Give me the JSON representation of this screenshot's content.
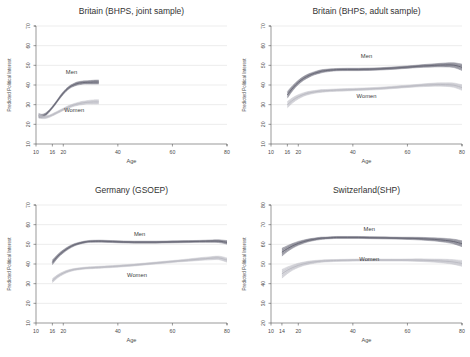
{
  "figure": {
    "title": "",
    "panel_count": 4
  },
  "chart_data": [
    {
      "type": "line",
      "title": "Britain (BHPS, joint sample)",
      "xlabel": "Age",
      "ylabel": "Predicted Political Interest",
      "xlim": [
        10,
        80
      ],
      "ylim": [
        10,
        70
      ],
      "xticks": [
        10,
        16,
        20,
        40,
        60,
        80
      ],
      "yticks": [
        10,
        20,
        30,
        40,
        50,
        60,
        70
      ],
      "grid": true,
      "legend_position": "inline-annotation",
      "annotations": [
        {
          "text": "Men",
          "x": 23,
          "y": 45.5
        },
        {
          "text": "Women",
          "x": 24,
          "y": 26.5
        }
      ],
      "series": [
        {
          "name": "Men",
          "color": "#6a6a78",
          "x": [
            11,
            12,
            13,
            14,
            15,
            16,
            17,
            18,
            19,
            20,
            21,
            22,
            23,
            24,
            25,
            26,
            27,
            28,
            29,
            30,
            31,
            32,
            33
          ],
          "values": [
            24.3,
            24.2,
            24.6,
            25.6,
            27.0,
            28.6,
            30.4,
            32.3,
            34.2,
            35.9,
            37.4,
            38.6,
            39.5,
            40.2,
            40.7,
            41.0,
            41.2,
            41.3,
            41.4,
            41.4,
            41.5,
            41.5,
            41.5
          ],
          "band_lower": [
            23.2,
            23.3,
            23.8,
            24.9,
            26.4,
            28.0,
            29.8,
            31.7,
            33.5,
            35.2,
            36.7,
            37.9,
            38.8,
            39.4,
            39.9,
            40.2,
            40.4,
            40.5,
            40.5,
            40.5,
            40.5,
            40.5,
            40.5
          ],
          "band_upper": [
            25.4,
            25.1,
            25.4,
            26.3,
            27.6,
            29.2,
            31.0,
            32.9,
            34.9,
            36.6,
            38.1,
            39.3,
            40.2,
            40.9,
            41.5,
            41.8,
            42.0,
            42.1,
            42.2,
            42.3,
            42.4,
            42.5,
            42.5
          ]
        },
        {
          "name": "Women",
          "color": "#bcbcc4",
          "x": [
            11,
            12,
            13,
            14,
            15,
            16,
            17,
            18,
            19,
            20,
            21,
            22,
            23,
            24,
            25,
            26,
            27,
            28,
            29,
            30,
            31,
            32,
            33
          ],
          "values": [
            24.6,
            23.9,
            23.6,
            23.8,
            24.2,
            24.8,
            25.5,
            26.2,
            26.9,
            27.6,
            28.3,
            28.9,
            29.4,
            29.9,
            30.3,
            30.6,
            30.9,
            31.1,
            31.2,
            31.3,
            31.4,
            31.4,
            31.4
          ],
          "band_lower": [
            23.5,
            23.0,
            22.9,
            23.1,
            23.6,
            24.2,
            24.9,
            25.6,
            26.3,
            27.0,
            27.6,
            28.2,
            28.7,
            29.2,
            29.5,
            29.8,
            30.0,
            30.2,
            30.3,
            30.3,
            30.3,
            30.3,
            30.3
          ],
          "band_upper": [
            25.7,
            24.8,
            24.3,
            24.5,
            24.8,
            25.4,
            26.1,
            26.8,
            27.5,
            28.2,
            28.9,
            29.6,
            30.1,
            30.6,
            31.0,
            31.4,
            31.7,
            31.9,
            32.1,
            32.3,
            32.4,
            32.5,
            32.5
          ]
        }
      ]
    },
    {
      "type": "line",
      "title": "Britain (BHPS, adult sample)",
      "xlabel": "Age",
      "ylabel": "Predicted Political Interest",
      "xlim": [
        10,
        80
      ],
      "ylim": [
        10,
        70
      ],
      "xticks": [
        10,
        16,
        20,
        40,
        60,
        80
      ],
      "yticks": [
        10,
        20,
        30,
        40,
        50,
        60,
        70
      ],
      "grid": true,
      "legend_position": "inline-annotation",
      "annotations": [
        {
          "text": "Men",
          "x": 45,
          "y": 53.5
        },
        {
          "text": "Women",
          "x": 45,
          "y": 33.5
        }
      ],
      "series": [
        {
          "name": "Men",
          "color": "#6a6a78",
          "x": [
            16,
            18,
            20,
            22,
            24,
            26,
            28,
            30,
            34,
            38,
            42,
            46,
            50,
            54,
            58,
            62,
            66,
            70,
            74,
            77,
            80
          ],
          "values": [
            35.0,
            38.5,
            41.3,
            43.4,
            44.9,
            46.0,
            46.8,
            47.3,
            47.8,
            47.9,
            47.9,
            48.0,
            48.2,
            48.5,
            48.9,
            49.3,
            49.7,
            50.0,
            50.2,
            50.1,
            49.0
          ],
          "band_lower": [
            33.3,
            37.2,
            40.2,
            42.4,
            44.0,
            45.2,
            46.0,
            46.6,
            47.2,
            47.3,
            47.3,
            47.4,
            47.6,
            47.9,
            48.3,
            48.7,
            49.0,
            49.2,
            49.2,
            48.9,
            47.4
          ],
          "band_upper": [
            36.7,
            39.8,
            42.4,
            44.4,
            45.8,
            46.8,
            47.6,
            48.0,
            48.4,
            48.5,
            48.5,
            48.6,
            48.8,
            49.1,
            49.5,
            49.9,
            50.4,
            50.8,
            51.2,
            51.3,
            50.6
          ]
        },
        {
          "name": "Women",
          "color": "#bcbcc4",
          "x": [
            16,
            18,
            20,
            22,
            24,
            26,
            28,
            30,
            34,
            38,
            42,
            46,
            50,
            54,
            58,
            62,
            66,
            70,
            74,
            77,
            80
          ],
          "values": [
            30.0,
            32.3,
            34.0,
            35.2,
            36.0,
            36.5,
            36.9,
            37.1,
            37.4,
            37.6,
            37.8,
            38.0,
            38.3,
            38.7,
            39.1,
            39.5,
            39.9,
            40.2,
            40.2,
            39.9,
            38.7
          ],
          "band_lower": [
            28.4,
            31.0,
            32.9,
            34.3,
            35.2,
            35.8,
            36.2,
            36.5,
            36.8,
            37.0,
            37.2,
            37.4,
            37.7,
            38.1,
            38.5,
            38.9,
            39.2,
            39.4,
            39.3,
            38.8,
            37.3
          ],
          "band_upper": [
            31.6,
            33.6,
            35.1,
            36.1,
            36.8,
            37.2,
            37.6,
            37.7,
            38.0,
            38.2,
            38.4,
            38.6,
            38.9,
            39.3,
            39.7,
            40.1,
            40.6,
            41.0,
            41.1,
            41.0,
            40.1
          ]
        }
      ]
    },
    {
      "type": "line",
      "title": "Germany (GSOEP)",
      "xlabel": "Age",
      "ylabel": "Predicted Political Interest",
      "xlim": [
        10,
        80
      ],
      "ylim": [
        10,
        70
      ],
      "xticks": [
        10,
        16,
        20,
        40,
        60,
        80
      ],
      "yticks": [
        10,
        20,
        30,
        40,
        50,
        60,
        70
      ],
      "grid": true,
      "legend_position": "inline-annotation",
      "annotations": [
        {
          "text": "Men",
          "x": 48,
          "y": 54.0
        },
        {
          "text": "Women",
          "x": 47,
          "y": 33.5
        }
      ],
      "series": [
        {
          "name": "Men",
          "color": "#6a6a78",
          "x": [
            16,
            18,
            20,
            22,
            24,
            26,
            28,
            30,
            34,
            38,
            42,
            46,
            50,
            54,
            58,
            62,
            66,
            70,
            74,
            77,
            80
          ],
          "values": [
            40.8,
            44.0,
            46.4,
            48.3,
            49.7,
            50.6,
            51.2,
            51.5,
            51.6,
            51.4,
            51.2,
            51.1,
            51.1,
            51.1,
            51.2,
            51.3,
            51.4,
            51.5,
            51.6,
            51.6,
            51.0
          ],
          "band_lower": [
            39.6,
            43.1,
            45.6,
            47.6,
            49.1,
            50.1,
            50.7,
            51.0,
            51.1,
            50.9,
            50.7,
            50.6,
            50.6,
            50.6,
            50.7,
            50.8,
            50.9,
            51.0,
            51.0,
            50.9,
            50.1
          ],
          "band_upper": [
            42.0,
            44.9,
            47.2,
            49.0,
            50.3,
            51.1,
            51.7,
            52.0,
            52.1,
            51.9,
            51.7,
            51.6,
            51.6,
            51.6,
            51.7,
            51.8,
            51.9,
            52.0,
            52.2,
            52.3,
            51.9
          ]
        },
        {
          "name": "Women",
          "color": "#bcbcc4",
          "x": [
            16,
            18,
            20,
            22,
            24,
            26,
            28,
            30,
            34,
            38,
            42,
            46,
            50,
            54,
            58,
            62,
            66,
            70,
            74,
            77,
            80
          ],
          "values": [
            31.5,
            33.8,
            35.4,
            36.5,
            37.2,
            37.6,
            37.9,
            38.1,
            38.4,
            38.7,
            39.1,
            39.5,
            40.0,
            40.5,
            41.0,
            41.5,
            42.0,
            42.5,
            42.9,
            43.1,
            42.0
          ],
          "band_lower": [
            30.5,
            33.0,
            34.7,
            35.9,
            36.7,
            37.1,
            37.4,
            37.6,
            37.9,
            38.2,
            38.6,
            39.0,
            39.5,
            40.0,
            40.5,
            41.0,
            41.4,
            41.8,
            42.1,
            42.2,
            40.9
          ],
          "band_upper": [
            32.5,
            34.6,
            36.1,
            37.1,
            37.7,
            38.1,
            38.4,
            38.6,
            38.9,
            39.2,
            39.6,
            40.0,
            40.5,
            41.0,
            41.5,
            42.0,
            42.6,
            43.2,
            43.7,
            44.0,
            43.1
          ]
        }
      ]
    },
    {
      "type": "line",
      "title": "Switzerland(SHP)",
      "xlabel": "Age",
      "ylabel": "Predicted Political Interest",
      "xlim": [
        10,
        80
      ],
      "ylim": [
        20,
        80
      ],
      "xticks": [
        10,
        14,
        20,
        40,
        60,
        80
      ],
      "yticks": [
        20,
        30,
        40,
        50,
        60,
        70,
        80
      ],
      "grid": true,
      "legend_position": "inline-annotation",
      "annotations": [
        {
          "text": "Men",
          "x": 46,
          "y": 67.0
        },
        {
          "text": "Women",
          "x": 46,
          "y": 51.5
        }
      ],
      "series": [
        {
          "name": "Men",
          "color": "#6a6a78",
          "x": [
            14,
            16,
            18,
            20,
            22,
            24,
            26,
            28,
            30,
            34,
            38,
            42,
            46,
            50,
            54,
            58,
            62,
            66,
            70,
            74,
            77,
            80
          ],
          "values": [
            56.0,
            57.8,
            59.3,
            60.5,
            61.4,
            62.1,
            62.6,
            63.0,
            63.2,
            63.5,
            63.5,
            63.5,
            63.4,
            63.3,
            63.2,
            63.1,
            63.0,
            62.8,
            62.5,
            62.0,
            61.4,
            60.3
          ],
          "band_lower": [
            54.0,
            56.3,
            58.1,
            59.5,
            60.6,
            61.4,
            62.0,
            62.4,
            62.7,
            63.0,
            63.0,
            63.0,
            62.9,
            62.8,
            62.7,
            62.6,
            62.4,
            62.1,
            61.7,
            61.0,
            60.2,
            58.8
          ],
          "band_upper": [
            58.0,
            59.3,
            60.5,
            61.5,
            62.2,
            62.8,
            63.2,
            63.6,
            63.7,
            64.0,
            64.0,
            64.0,
            63.9,
            63.8,
            63.7,
            63.6,
            63.6,
            63.5,
            63.3,
            63.0,
            62.6,
            61.8
          ]
        },
        {
          "name": "Women",
          "color": "#bcbcc4",
          "x": [
            14,
            16,
            18,
            20,
            22,
            24,
            26,
            28,
            30,
            34,
            38,
            42,
            46,
            50,
            54,
            58,
            62,
            66,
            70,
            74,
            77,
            80
          ],
          "values": [
            45.0,
            46.8,
            48.2,
            49.3,
            50.1,
            50.7,
            51.1,
            51.4,
            51.6,
            51.8,
            51.9,
            52.0,
            52.0,
            52.0,
            52.0,
            52.0,
            52.0,
            51.9,
            51.7,
            51.4,
            51.0,
            50.3
          ],
          "band_lower": [
            42.8,
            45.1,
            46.9,
            48.2,
            49.2,
            49.9,
            50.4,
            50.8,
            51.0,
            51.3,
            51.4,
            51.5,
            51.5,
            51.5,
            51.5,
            51.5,
            51.4,
            51.2,
            50.9,
            50.4,
            49.8,
            48.8
          ],
          "band_upper": [
            47.2,
            48.5,
            49.5,
            50.4,
            51.0,
            51.5,
            51.8,
            52.0,
            52.2,
            52.3,
            52.4,
            52.5,
            52.5,
            52.5,
            52.5,
            52.5,
            52.6,
            52.6,
            52.5,
            52.4,
            52.2,
            51.8
          ]
        }
      ]
    }
  ],
  "colors": {
    "men_band": "#6a6a78",
    "women_band": "#bcbcc4",
    "grid": "#d8d8d8",
    "axis": "#555555",
    "text": "#333333",
    "background": "#ffffff"
  }
}
